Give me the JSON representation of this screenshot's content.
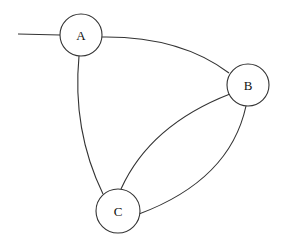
{
  "diagram": {
    "type": "graph",
    "nodes": [
      {
        "id": "A",
        "label": "A",
        "cx": 81,
        "cy": 35,
        "r": 21
      },
      {
        "id": "B",
        "label": "B",
        "cx": 248,
        "cy": 85,
        "r": 21
      },
      {
        "id": "C",
        "label": "C",
        "cx": 118,
        "cy": 211,
        "r": 22
      }
    ],
    "edges": [
      {
        "from": "external",
        "to": "A",
        "label": ""
      },
      {
        "from": "A",
        "to": "B",
        "label": ""
      },
      {
        "from": "A",
        "to": "C",
        "label": ""
      },
      {
        "from": "C",
        "to": "B",
        "label": "",
        "note": "upper arc"
      },
      {
        "from": "C",
        "to": "B",
        "label": "",
        "note": "lower arc"
      }
    ],
    "colors": {
      "stroke": "#333333",
      "background": "#ffffff",
      "node_fill": "#ffffff"
    }
  }
}
